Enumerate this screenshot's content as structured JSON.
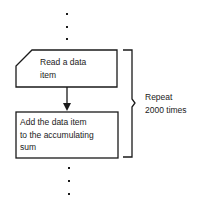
{
  "diagram": {
    "type": "flowchart",
    "nodes": [
      {
        "id": "read",
        "shape": "card",
        "label_lines": [
          "Read a data",
          "item"
        ]
      },
      {
        "id": "add",
        "shape": "process",
        "label_lines": [
          "Add the data item",
          "to the accumulating",
          "sum"
        ]
      }
    ],
    "edges": [
      {
        "from": "read",
        "to": "add"
      }
    ],
    "loop_annotation": {
      "label_lines": [
        "Repeat",
        "2000 times"
      ]
    },
    "continuation_dots": {
      "above": 3,
      "below": 3
    }
  },
  "colors": {
    "stroke": "#1a1a1a",
    "background": "#ffffff"
  }
}
